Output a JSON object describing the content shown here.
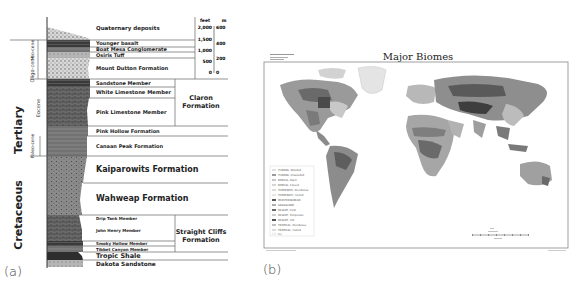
{
  "panels": {
    "a": {
      "label": "(a)"
    },
    "b": {
      "label": "(b)"
    }
  },
  "column": {
    "eras": [
      {
        "name": "Tertiary"
      },
      {
        "name": "Cretaceous"
      }
    ],
    "epochs": [
      {
        "name": "Mio-cene"
      },
      {
        "name": "Oligo-cene"
      },
      {
        "name": "Eocene"
      },
      {
        "name": "Paleo-cene"
      }
    ],
    "units": [
      {
        "name": "Quaternary deposits"
      },
      {
        "name": "Younger basalt"
      },
      {
        "name": "Boat Mesa Conglomerate"
      },
      {
        "name": "Osiris Tuff"
      },
      {
        "name": "Mount Dutton Formation"
      },
      {
        "name": "Sandstone Member"
      },
      {
        "name": "White Limestone Member"
      },
      {
        "name": "Pink Limestone Member"
      },
      {
        "name": "Pink Hollow Formation"
      },
      {
        "name": "Canaan Peak Formation"
      },
      {
        "name": "Kaiparowits Formation"
      },
      {
        "name": "Wahweap Formation"
      },
      {
        "name": "Drip Tank Member"
      },
      {
        "name": "John Henry Member"
      },
      {
        "name": "Smoky Hollow Member"
      },
      {
        "name": "Tibbet Canyon Member"
      },
      {
        "name": "Tropic Shale"
      },
      {
        "name": "Dakota Sandstone"
      }
    ],
    "groups": [
      {
        "name1": "Claron",
        "name2": "Formation"
      },
      {
        "name1": "Straight Cliffs",
        "name2": "Formation"
      }
    ],
    "scale": {
      "feet_label": "feet",
      "m_label": "m",
      "feet_ticks": [
        "2,000",
        "1,500",
        "1,000",
        "500",
        "0"
      ],
      "m_ticks": [
        "600",
        "400",
        "200",
        "0"
      ]
    }
  },
  "map": {
    "title": "Major Biomes",
    "legend": [
      "TUNDRA, Wooded",
      "TUNDRA, Unwooded",
      "BOREAL, Open",
      "BOREAL, Closed",
      "TEMPERATE, Deciduous",
      "TEMPERATE, Humid",
      "MEDITERRANEAN",
      "GRASSLAND",
      "DESERT, Cold",
      "DESERT, Temperate",
      "DESERT, Hot",
      "TROPICAL, Deciduous",
      "TROPICAL, Humid",
      "Ice"
    ]
  }
}
